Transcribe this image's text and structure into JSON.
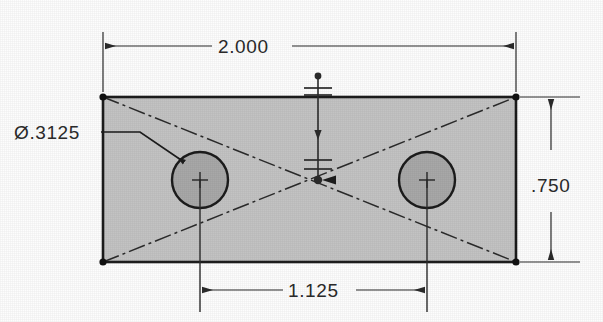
{
  "drawing": {
    "type": "orthographic-engineering-drawing",
    "title": "Rectangular plate with two through holes",
    "units": "inches",
    "canvas": {
      "width": 603,
      "height": 322,
      "background": "#fdfdfd"
    },
    "colors": {
      "plate_fill": "#c3c3c3",
      "hole_fill": "#a8a8a8",
      "outline": "#1c1c1c",
      "dimension_line": "#2b2b2b",
      "centerline": "#2b2b2b",
      "text": "#2b2b2b"
    },
    "part": {
      "name": "plate",
      "shape": "rectangle",
      "x": 103,
      "y": 97,
      "width": 413,
      "height": 165
    },
    "holes": [
      {
        "name": "hole-left",
        "cx": 200,
        "cy": 180,
        "r": 28,
        "diameter_label": ".3125"
      },
      {
        "name": "hole-right",
        "cx": 427,
        "cy": 180,
        "r": 28,
        "diameter_label": ".3125"
      }
    ],
    "dimensions": [
      {
        "id": "overall-width",
        "value": "2.000",
        "orientation": "horizontal",
        "placement": "top",
        "from": 103,
        "to": 516,
        "line_y": 40
      },
      {
        "id": "overall-height",
        "value": ".750",
        "orientation": "vertical",
        "placement": "right",
        "from": 97,
        "to": 262,
        "line_x": 551
      },
      {
        "id": "hole-spacing",
        "value": "1.125",
        "orientation": "horizontal",
        "placement": "bottom",
        "from": 200,
        "to": 427,
        "line_y": 290
      }
    ],
    "callouts": [
      {
        "id": "hole-diameter",
        "symbol": "Ø",
        "value": ".3125",
        "full_text": "Ø.3125",
        "text_x": 14,
        "text_y": 139,
        "leader_points": "101,132 140,132 186,163",
        "target": "hole-left"
      }
    ],
    "centerlines": [
      {
        "id": "diagonal-a",
        "x1": 103,
        "y1": 97,
        "x2": 516,
        "y2": 262
      },
      {
        "id": "diagonal-b",
        "x1": 103,
        "y1": 262,
        "x2": 516,
        "y2": 97
      },
      {
        "id": "hole-left-vertical",
        "x1": 200,
        "y1": 180,
        "x2": 200,
        "y2": 310
      },
      {
        "id": "hole-right-vertical",
        "x1": 427,
        "y1": 180,
        "x2": 427,
        "y2": 310
      }
    ],
    "center_mark": {
      "id": "center-datum",
      "x": 318,
      "top_y": 76,
      "bottom_y": 181,
      "tick_count": 4
    }
  }
}
